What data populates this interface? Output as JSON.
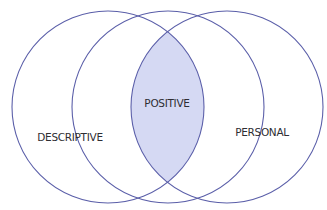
{
  "diagram": {
    "type": "venn",
    "colors": {
      "stroke": "#5b5fa9",
      "highlight_fill": "#d5d9f3",
      "background": "#ffffff",
      "text": "#2e2e33"
    },
    "sets": [
      {
        "id": "descriptive",
        "label": "DESCRIPTIVE"
      },
      {
        "id": "middle",
        "label": ""
      },
      {
        "id": "personal",
        "label": "PERSONAL"
      }
    ],
    "highlighted_region": {
      "label": "POSITIVE",
      "between": [
        "descriptive",
        "personal"
      ]
    }
  }
}
